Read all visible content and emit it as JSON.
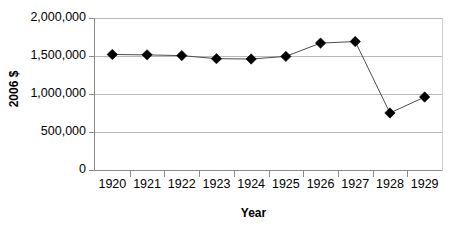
{
  "chart_data": {
    "type": "line",
    "title": "",
    "subtitle": "",
    "xlabel": "Year",
    "ylabel": "2006 $",
    "categories": [
      "1920",
      "1921",
      "1922",
      "1923",
      "1924",
      "1925",
      "1926",
      "1927",
      "1928",
      "1929"
    ],
    "values": [
      1520000,
      1515000,
      1505000,
      1465000,
      1460000,
      1495000,
      1670000,
      1690000,
      750000,
      960000
    ],
    "series": [
      {
        "name": "2006 $",
        "values": [
          1520000,
          1515000,
          1505000,
          1465000,
          1460000,
          1495000,
          1670000,
          1690000,
          750000,
          960000
        ]
      }
    ],
    "ylim": [
      0,
      2000000
    ],
    "yticks": [
      0,
      500000,
      1000000,
      1500000,
      2000000
    ],
    "ytick_labels": [
      "0",
      "500,000",
      "1,000,000",
      "1,500,000",
      "2,000,000"
    ],
    "xtick_labels": [
      "1920",
      "1921",
      "1922",
      "1923",
      "1924",
      "1925",
      "1926",
      "1927",
      "1928",
      "1929"
    ],
    "grid": "horizontal",
    "legend": "none",
    "marker": "diamond",
    "marker_color": "#000000",
    "line_color": "#4d4d4d",
    "gridline_color": "#b9b9b9",
    "axis_color": "#8a8a8a",
    "background": "#ffffff"
  }
}
